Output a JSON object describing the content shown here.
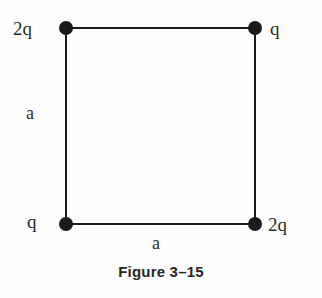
{
  "figure": {
    "caption": "Figure 3–15",
    "shape": "square",
    "corner_labels": {
      "top_left": "2q",
      "top_right": "q",
      "bottom_left": "q",
      "bottom_right": "2q"
    },
    "side_labels": {
      "left": "a",
      "bottom": "a"
    },
    "colors": {
      "line": "#1c1c1c",
      "node": "#1a1a1a",
      "text": "#2a2a2a",
      "caption": "#262626",
      "background": "#fefefe"
    }
  },
  "chart_data": {
    "type": "diagram",
    "title": "Figure 3–15",
    "nodes": [
      {
        "id": "top-left",
        "label": "2q",
        "x": 0,
        "y": 1
      },
      {
        "id": "top-right",
        "label": "q",
        "x": 1,
        "y": 1
      },
      {
        "id": "bottom-left",
        "label": "q",
        "x": 0,
        "y": 0
      },
      {
        "id": "bottom-right",
        "label": "2q",
        "x": 1,
        "y": 0
      }
    ],
    "edges": [
      {
        "from": "top-left",
        "to": "top-right",
        "label": ""
      },
      {
        "from": "top-right",
        "to": "bottom-right",
        "label": ""
      },
      {
        "from": "bottom-right",
        "to": "bottom-left",
        "label": "a"
      },
      {
        "from": "bottom-left",
        "to": "top-left",
        "label": "a"
      }
    ],
    "side_length": "a"
  }
}
